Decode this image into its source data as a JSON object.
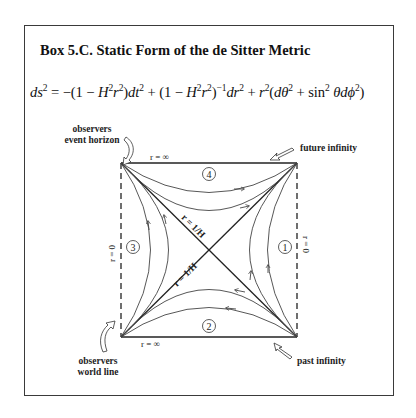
{
  "box": {
    "title": "Box 5.C. Static Form of the de Sitter Metric",
    "equation": {
      "parts": [
        {
          "t": "ds",
          "i": true
        },
        {
          "t": "2",
          "sup": true
        },
        {
          "t": " = −(1 − "
        },
        {
          "t": "H",
          "i": true
        },
        {
          "t": "2",
          "sup": true
        },
        {
          "t": "r",
          "i": true
        },
        {
          "t": "2",
          "sup": true
        },
        {
          "t": ")"
        },
        {
          "t": "dt",
          "i": true
        },
        {
          "t": "2",
          "sup": true
        },
        {
          "t": " + (1 − "
        },
        {
          "t": "H",
          "i": true
        },
        {
          "t": "2",
          "sup": true
        },
        {
          "t": "r",
          "i": true
        },
        {
          "t": "2",
          "sup": true
        },
        {
          "t": ")"
        },
        {
          "t": "−1",
          "sup": true
        },
        {
          "t": "dr",
          "i": true
        },
        {
          "t": "2",
          "sup": true
        },
        {
          "t": " + "
        },
        {
          "t": "r",
          "i": true
        },
        {
          "t": "2",
          "sup": true
        },
        {
          "t": "("
        },
        {
          "t": "dθ",
          "i": true
        },
        {
          "t": "2",
          "sup": true
        },
        {
          "t": " + sin"
        },
        {
          "t": "2",
          "sup": true
        },
        {
          "t": " "
        },
        {
          "t": "θdϕ",
          "i": true
        },
        {
          "t": "2",
          "sup": true
        },
        {
          "t": ")"
        }
      ]
    }
  },
  "diagram": {
    "labels": {
      "event_horizon": [
        "observers",
        "event horizon"
      ],
      "world_line": [
        "observers",
        "world line"
      ],
      "future_infinity": "future infinity",
      "past_infinity": "past infinity",
      "top_edge": "r = ∞",
      "bottom_edge": "r = ∞",
      "left_edge": "r = 0",
      "right_edge": "r = 0",
      "diag_upper": "r = 1/H",
      "diag_lower": "r = 1/H"
    },
    "regions": [
      "①",
      "②",
      "③",
      "④"
    ],
    "regions_meta": [
      {
        "id": "1",
        "side": "right",
        "flow": "up"
      },
      {
        "id": "2",
        "side": "bottom",
        "flow": "left"
      },
      {
        "id": "3",
        "side": "left",
        "flow": "up"
      },
      {
        "id": "4",
        "side": "top",
        "flow": "right"
      }
    ]
  }
}
